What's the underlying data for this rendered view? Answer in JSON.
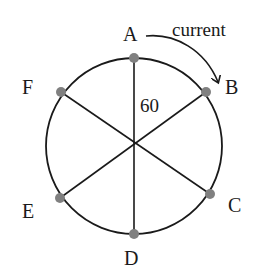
{
  "diagram": {
    "title": "",
    "center": {
      "x": 134,
      "y": 146
    },
    "radius": 88,
    "angle_label": "60",
    "arrow_label": "current",
    "points": [
      {
        "id": "A",
        "label": "A",
        "x": 134,
        "y": 58,
        "lx": 130,
        "ly": 40
      },
      {
        "id": "B",
        "label": "B",
        "x": 206,
        "y": 92,
        "lx": 226,
        "ly": 93
      },
      {
        "id": "C",
        "label": "C",
        "x": 210,
        "y": 194,
        "lx": 229,
        "ly": 211
      },
      {
        "id": "D",
        "label": "D",
        "x": 134,
        "y": 234,
        "lx": 131,
        "ly": 266
      },
      {
        "id": "E",
        "label": "E",
        "x": 60,
        "y": 198,
        "lx": 24,
        "ly": 217
      },
      {
        "id": "F",
        "label": "F",
        "x": 61,
        "y": 92,
        "lx": 22,
        "ly": 93
      }
    ],
    "colors": {
      "stroke": "#1a1a1a",
      "point": "#808080",
      "text": "#1a1a1a"
    }
  }
}
